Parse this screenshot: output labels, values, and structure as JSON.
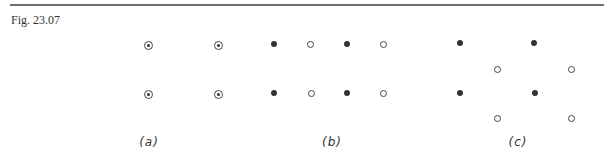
{
  "caption": "Fig. 23.07",
  "colors": {
    "ink": "#333333",
    "rule": "#6f6f6f"
  },
  "panels": [
    {
      "label": "(a)",
      "label_pos": [
        149,
        135
      ],
      "points": [
        {
          "x": 148,
          "y": 45,
          "type": "dot"
        },
        {
          "x": 218,
          "y": 45,
          "type": "dot"
        },
        {
          "x": 148,
          "y": 94,
          "type": "dot"
        },
        {
          "x": 218,
          "y": 94,
          "type": "dot"
        }
      ]
    },
    {
      "label": "(b)",
      "label_pos": [
        332,
        135
      ],
      "points": [
        {
          "x": 274,
          "y": 44,
          "type": "filled"
        },
        {
          "x": 310,
          "y": 44,
          "type": "open"
        },
        {
          "x": 347,
          "y": 44,
          "type": "filled"
        },
        {
          "x": 383,
          "y": 44,
          "type": "open"
        },
        {
          "x": 274,
          "y": 93,
          "type": "filled"
        },
        {
          "x": 311,
          "y": 93,
          "type": "open"
        },
        {
          "x": 347,
          "y": 93,
          "type": "filled"
        },
        {
          "x": 383,
          "y": 93,
          "type": "open"
        }
      ]
    },
    {
      "label": "(c)",
      "label_pos": [
        518,
        135
      ],
      "points": [
        {
          "x": 460,
          "y": 43,
          "type": "filled"
        },
        {
          "x": 534,
          "y": 43,
          "type": "filled"
        },
        {
          "x": 497,
          "y": 69,
          "type": "open"
        },
        {
          "x": 571,
          "y": 69,
          "type": "open"
        },
        {
          "x": 460,
          "y": 93,
          "type": "filled"
        },
        {
          "x": 535,
          "y": 93,
          "type": "filled"
        },
        {
          "x": 497,
          "y": 118,
          "type": "open"
        },
        {
          "x": 571,
          "y": 118,
          "type": "open"
        }
      ]
    }
  ]
}
